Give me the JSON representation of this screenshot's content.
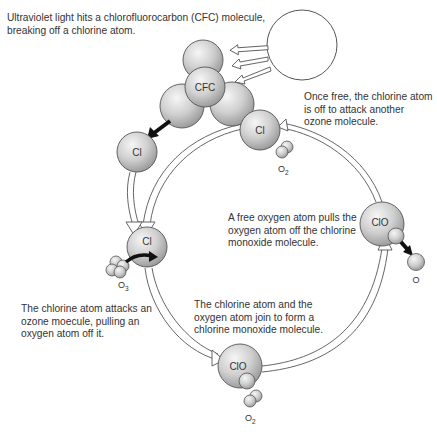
{
  "captions": {
    "uv": "Ultraviolet light hits a chlorofluorocarbon (CFC) molecule, breaking off a chlorine atom.",
    "free": "Once free, the chlorine atom is off to attack another ozone molecule.",
    "pull": "A free oxygen atom pulls the oxygen atom off the chlorine monoxide molecule.",
    "attack": "The chlorine atom attacks an ozone moecule, pulling an oxygen atom off it.",
    "join": "The chlorine atom and the oxygen atom join to form a chlorine monoxide molecule."
  },
  "labels": {
    "cfc": "CFC",
    "cl_top": "Cl",
    "cl_left": "Cl",
    "cl_attack": "Cl",
    "clo_right": "ClO",
    "clo_bottom": "ClO",
    "o2_top": "O",
    "o2_top_sub": "2",
    "o3": "O",
    "o3_sub": "3",
    "o_free": "O",
    "o2_bottom": "O",
    "o2_bottom_sub": "2"
  },
  "colors": {
    "sphere_light": "#f4f4f4",
    "sphere_dark": "#a8a8a8",
    "stroke": "#555555",
    "arrow_black": "#111111"
  }
}
